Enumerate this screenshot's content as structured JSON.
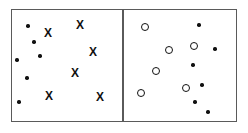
{
  "figure": {
    "width": 248,
    "height": 133,
    "background_color": "#ffffff",
    "frame": {
      "x": 11,
      "y": 9,
      "width": 226,
      "height": 113,
      "stroke_color": "#5a5a5a",
      "stroke_width": 1.5
    },
    "divider": {
      "x": 122,
      "y": 9,
      "width": 1.5,
      "height": 113,
      "color": "#5a5a5a"
    }
  },
  "marker_styles": {
    "dot": {
      "shape": "filled-circle",
      "diameter": 3.4,
      "color": "#111111"
    },
    "circle": {
      "shape": "open-circle",
      "diameter": 8.4,
      "stroke_width": 1.7,
      "color": "#111111"
    },
    "cross": {
      "shape": "letter-x",
      "glyph": "X",
      "font_size": 12,
      "color": "#111111"
    }
  },
  "panels": [
    {
      "id": "left-panel",
      "label": "left",
      "bounds": {
        "x": 11,
        "y": 9,
        "width": 111,
        "height": 113
      },
      "dots": [
        {
          "x": 28,
          "y": 26
        },
        {
          "x": 34,
          "y": 42
        },
        {
          "x": 40,
          "y": 56
        },
        {
          "x": 17,
          "y": 60
        },
        {
          "x": 27,
          "y": 78
        },
        {
          "x": 19,
          "y": 102
        }
      ],
      "crosses": [
        {
          "x": 48,
          "y": 33
        },
        {
          "x": 80,
          "y": 25
        },
        {
          "x": 93,
          "y": 52
        },
        {
          "x": 75,
          "y": 73
        },
        {
          "x": 49,
          "y": 96
        },
        {
          "x": 100,
          "y": 97
        }
      ],
      "circles": [],
      "counts": {
        "dots": 6,
        "crosses": 6,
        "circles": 0
      }
    },
    {
      "id": "right-panel",
      "label": "right",
      "bounds": {
        "x": 123,
        "y": 9,
        "width": 114,
        "height": 113
      },
      "dots": [
        {
          "x": 199,
          "y": 25
        },
        {
          "x": 215,
          "y": 49
        },
        {
          "x": 193,
          "y": 65
        },
        {
          "x": 202,
          "y": 85
        },
        {
          "x": 195,
          "y": 102
        },
        {
          "x": 208,
          "y": 112
        }
      ],
      "circles": [
        {
          "x": 145,
          "y": 27
        },
        {
          "x": 194,
          "y": 46
        },
        {
          "x": 169,
          "y": 50
        },
        {
          "x": 156,
          "y": 71
        },
        {
          "x": 186,
          "y": 88
        },
        {
          "x": 141,
          "y": 93
        }
      ],
      "crosses": [],
      "counts": {
        "dots": 6,
        "crosses": 0,
        "circles": 6
      }
    }
  ]
}
